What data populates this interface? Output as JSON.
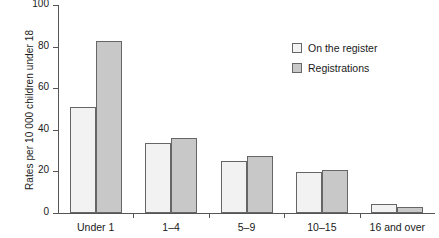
{
  "chart_data": {
    "type": "bar",
    "title": "",
    "xlabel": "",
    "ylabel": "Rates per 10 000 children under 18",
    "categories": [
      "Under 1",
      "1–4",
      "5–9",
      "10–15",
      "16 and over"
    ],
    "series": [
      {
        "name": "On the register",
        "color": "#f2f2f2",
        "values": [
          51,
          33.5,
          25,
          19.5,
          4.5
        ]
      },
      {
        "name": "Registrations",
        "color": "#c8c8c8",
        "values": [
          82.5,
          36,
          27.5,
          20.5,
          3
        ]
      }
    ],
    "ylim": [
      0,
      100
    ],
    "yticks": [
      0,
      20,
      40,
      60,
      80,
      100
    ],
    "ytick_labels": [
      "0",
      "20",
      "40",
      "60",
      "80",
      "100"
    ],
    "grid": false,
    "legend_position": "top-right",
    "bar_edge_color": "#666666",
    "axis_color": "#555555"
  }
}
